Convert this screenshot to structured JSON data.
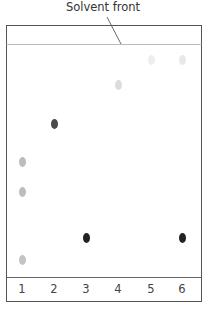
{
  "diagram": {
    "title": "Solvent front",
    "lanes": [
      {
        "label": "1",
        "x": 22
      },
      {
        "label": "2",
        "x": 54
      },
      {
        "label": "3",
        "x": 86
      },
      {
        "label": "4",
        "x": 118
      },
      {
        "label": "5",
        "x": 151
      },
      {
        "label": "6",
        "x": 182
      }
    ],
    "spots": [
      {
        "lane": "1",
        "x": 22,
        "y": 162,
        "color": "#bdbdbd"
      },
      {
        "lane": "1",
        "x": 22,
        "y": 192,
        "color": "#bdbdbd"
      },
      {
        "lane": "1",
        "x": 22,
        "y": 260,
        "color": "#c4c4c4"
      },
      {
        "lane": "2",
        "x": 54,
        "y": 124,
        "color": "#4a4a4a"
      },
      {
        "lane": "3",
        "x": 86,
        "y": 238,
        "color": "#222222"
      },
      {
        "lane": "4",
        "x": 118,
        "y": 85,
        "color": "#dcdcdc"
      },
      {
        "lane": "5",
        "x": 151,
        "y": 60,
        "color": "#eeeeee"
      },
      {
        "lane": "6",
        "x": 182,
        "y": 60,
        "color": "#e8e8e8"
      },
      {
        "lane": "6",
        "x": 182,
        "y": 238,
        "color": "#222222"
      }
    ],
    "colors": {
      "frame": "#555555",
      "solvent_line": "#bbbbbb"
    }
  }
}
